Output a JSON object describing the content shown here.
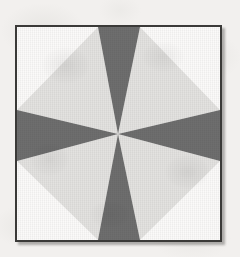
{
  "page": {
    "background_color": "#f2f0ee",
    "width": 240,
    "height": 257
  },
  "block": {
    "name": "eight-wedge radial star block",
    "frame": {
      "border_color": "#3b3a38",
      "border_width": 2,
      "left": 15,
      "top": 25,
      "width": 207,
      "height": 217,
      "shadow_color": "#5a5856"
    },
    "background_color": "#fbfaf9",
    "center": {
      "x": 101,
      "y": 107
    },
    "colors": {
      "dark_wedge": "#6e6e6e",
      "light_wedge": "#e3e2e0",
      "corner": "#fbfaf9",
      "outline": "#3b3a38"
    },
    "wedge_count": 8,
    "wedges": [
      {
        "name": "wedge-top",
        "tone": "dark",
        "color": "#6e6e6e",
        "points": "81,0 123,0 101,107"
      },
      {
        "name": "wedge-top-right",
        "tone": "light",
        "color": "#e3e2e0",
        "points": "123,0 203,83 101,107"
      },
      {
        "name": "wedge-right",
        "tone": "dark",
        "color": "#6e6e6e",
        "points": "203,83 203,134 101,107"
      },
      {
        "name": "wedge-bottom-right",
        "tone": "light",
        "color": "#e3e2e0",
        "points": "203,134 123,213 101,107"
      },
      {
        "name": "wedge-bottom",
        "tone": "dark",
        "color": "#6e6e6e",
        "points": "123,213 81,213 101,107"
      },
      {
        "name": "wedge-bottom-left",
        "tone": "light",
        "color": "#e3e2e0",
        "points": "81,213 0,134 101,107"
      },
      {
        "name": "wedge-left",
        "tone": "dark",
        "color": "#6e6e6e",
        "points": "0,134 0,83 101,107"
      },
      {
        "name": "wedge-top-left",
        "tone": "light",
        "color": "#e3e2e0",
        "points": "0,83 81,0 101,107"
      }
    ],
    "corners": [
      {
        "name": "corner-top-left",
        "color": "#fbfaf9",
        "points": "0,0 81,0 0,83"
      },
      {
        "name": "corner-top-right",
        "color": "#fbfaf9",
        "points": "123,0 203,0 203,83"
      },
      {
        "name": "corner-bottom-right",
        "color": "#fbfaf9",
        "points": "203,134 203,213 123,213"
      },
      {
        "name": "corner-bottom-left",
        "color": "#fbfaf9",
        "points": "0,134 81,213 0,213"
      }
    ]
  }
}
